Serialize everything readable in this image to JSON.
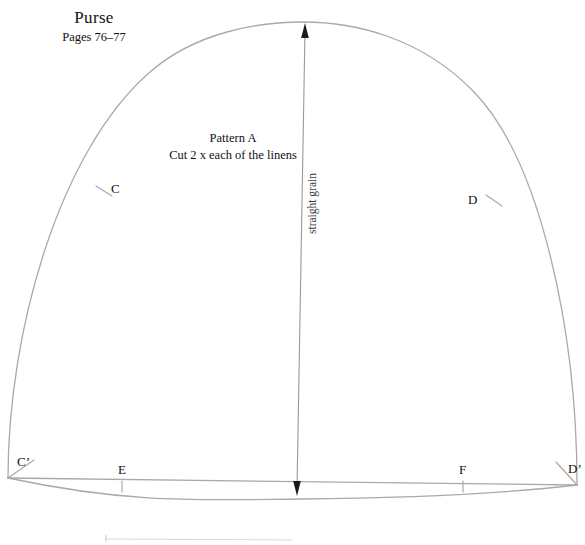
{
  "document": {
    "type": "sewing-pattern-sheet",
    "title": "Purse",
    "pages": "Pages 76–77"
  },
  "annotation": {
    "pattern_name": "Pattern A",
    "cut_instruction": "Cut 2 x each of the linens"
  },
  "grainline": {
    "label": "straight grain",
    "direction": "double-arrow-vertical"
  },
  "points": {
    "c": "C",
    "d": "D",
    "c_prime": "C’",
    "e": "E",
    "f": "F",
    "d_prime": "D’"
  },
  "colors": {
    "outline": "#a9a9a9",
    "grainline": "#9a9a9a",
    "arrowhead": "#1a1a1a",
    "text": "#111111",
    "background": "#ffffff",
    "faint_rule": "#d8d8d8"
  }
}
